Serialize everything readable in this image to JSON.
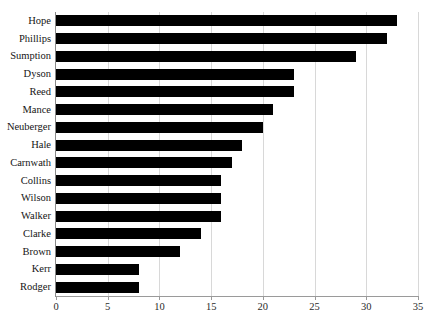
{
  "chart_data": {
    "type": "bar",
    "orientation": "horizontal",
    "title": "",
    "subtitle": "",
    "xlabel": "",
    "ylabel": "",
    "xlim": [
      0,
      35
    ],
    "ylim": null,
    "grid": true,
    "legend": false,
    "legend_position": "none",
    "bar_color": "#000000",
    "categories": [
      "Hope",
      "Phillips",
      "Sumption",
      "Dyson",
      "Reed",
      "Mance",
      "Neuberger",
      "Hale",
      "Carnwath",
      "Collins",
      "Wilson",
      "Walker",
      "Clarke",
      "Brown",
      "Kerr",
      "Rodger"
    ],
    "values": [
      33,
      32,
      29,
      23,
      23,
      21,
      20,
      18,
      17,
      16,
      16,
      16,
      14,
      12,
      8,
      8
    ],
    "xticks": [
      0,
      5,
      10,
      15,
      20,
      25,
      30,
      35
    ],
    "xticklabels": [
      "0",
      "5",
      "10",
      "15",
      "20",
      "25",
      "30",
      "35"
    ]
  },
  "axis": {
    "gridline_color": "#d8d8d8",
    "axis_color": "#8a8a8a"
  }
}
